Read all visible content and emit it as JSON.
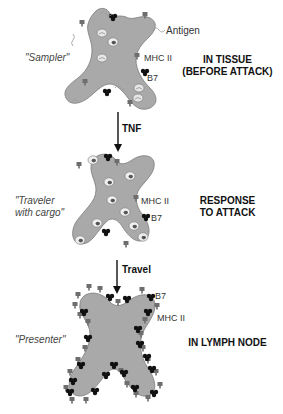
{
  "colors": {
    "cell_fill": "#a9a9a9",
    "cell_stroke": "#7a7a7a",
    "mhc_color": "#6e6e6e",
    "b7_color": "#111111",
    "vesicle_fill": "#e6e6e6"
  },
  "stages": [
    {
      "nickname": "\"Sampler\"",
      "title_line1": "IN TISSUE",
      "title_line2": "(BEFORE ATTACK)",
      "labels": {
        "antigen": "Antigen",
        "mhc": "MHC II",
        "b7": "B7"
      }
    },
    {
      "nickname_line1": "\"Traveler",
      "nickname_line2": "with cargo\"",
      "title_line1": "RESPONSE",
      "title_line2": "TO ATTACK",
      "labels": {
        "mhc": "MHC II",
        "b7": "B7"
      }
    },
    {
      "nickname": "\"Presenter\"",
      "title_line1": "IN LYMPH NODE",
      "labels": {
        "b7": "B7",
        "mhc": "MHC II"
      }
    }
  ],
  "arrows": [
    {
      "label": "TNF"
    },
    {
      "label": "Travel"
    }
  ]
}
